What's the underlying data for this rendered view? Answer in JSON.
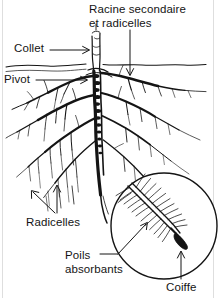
{
  "figure": {
    "title": "Racine secondaire et radicelles",
    "background_color": "#ffffff",
    "ink_color": "#141414",
    "width": 218,
    "height": 298
  },
  "labels": {
    "racine_secondaire": "Racine secondaire\net radicelles",
    "collet": "Collet",
    "pivot": "Pivot",
    "radicelles": "Radicelles",
    "poils_absorbants": "Poils\nabsorbants",
    "coiffe": "Coiffe"
  },
  "parts": [
    {
      "id": "racine-secondaire",
      "label": "Racine secondaire et radicelles",
      "leader": "arrow-down"
    },
    {
      "id": "collet",
      "label": "Collet",
      "leader": "arrow-right"
    },
    {
      "id": "pivot",
      "label": "Pivot",
      "leader": "arrow-right"
    },
    {
      "id": "radicelles",
      "label": "Radicelles",
      "leader": "arrow-up-left-and-up"
    },
    {
      "id": "poils-absorbants",
      "label": "Poils absorbants",
      "leader": "arrow-up-right"
    },
    {
      "id": "coiffe",
      "label": "Coiffe",
      "leader": "arrow-up"
    }
  ],
  "icons": {
    "soil_line": "soil-surface-line",
    "magnifier": "magnified-root-tip-circle",
    "root_cap": "root-cap-tip",
    "root_hairs": "root-hairs"
  }
}
